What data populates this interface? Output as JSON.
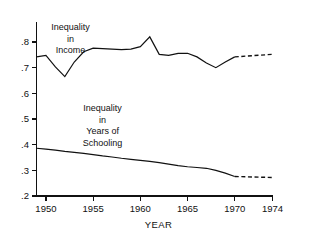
{
  "chart_data": {
    "type": "line",
    "title": "",
    "subtitle": "",
    "xlabel": "YEAR",
    "ylabel": "",
    "xlim": [
      1949,
      1974
    ],
    "ylim": [
      0.2,
      0.85
    ],
    "grid": false,
    "legend_position": "inline-annotations",
    "xticks": [
      1950,
      1955,
      1960,
      1965,
      1970,
      1974
    ],
    "xticklabels": [
      "1950",
      "1955",
      "1960",
      "1965",
      "1970",
      "1974"
    ],
    "yticks": [
      0.2,
      0.3,
      0.4,
      0.5,
      0.6,
      0.7,
      0.8
    ],
    "yticklabels": [
      ".2",
      ".3",
      ".4",
      ".5",
      ".6",
      ".7",
      ".8"
    ],
    "annotations": [
      {
        "name": "income-series-label",
        "lines": [
          "Inequality",
          "in",
          "Income"
        ],
        "text": "Inequality in Income",
        "x": 1952.6,
        "y": 0.845
      },
      {
        "name": "schooling-series-label",
        "lines": [
          "Inequality",
          "in",
          "Years of",
          "Schooling"
        ],
        "text": "Inequality in Years of Schooling",
        "x": 1956.0,
        "y": 0.53
      }
    ],
    "series": [
      {
        "name": "Inequality in Income",
        "style": "solid-then-dashed",
        "dash_start_year": 1970,
        "x": [
          1949,
          1950,
          1951,
          1952,
          1953,
          1954,
          1955,
          1956,
          1957,
          1958,
          1959,
          1960,
          1961,
          1962,
          1963,
          1964,
          1965,
          1966,
          1967,
          1968,
          1969,
          1970,
          1974
        ],
        "values": [
          0.742,
          0.748,
          0.703,
          0.665,
          0.722,
          0.762,
          0.776,
          0.774,
          0.772,
          0.77,
          0.772,
          0.782,
          0.82,
          0.752,
          0.748,
          0.756,
          0.756,
          0.742,
          0.718,
          0.7,
          0.722,
          0.742,
          0.752
        ]
      },
      {
        "name": "Inequality in Years of Schooling",
        "style": "solid-then-dashed",
        "dash_start_year": 1970,
        "x": [
          1949,
          1950,
          1951,
          1952,
          1953,
          1954,
          1955,
          1956,
          1957,
          1958,
          1959,
          1960,
          1961,
          1962,
          1963,
          1964,
          1965,
          1966,
          1967,
          1968,
          1969,
          1970,
          1974
        ],
        "values": [
          0.386,
          0.383,
          0.379,
          0.374,
          0.37,
          0.366,
          0.361,
          0.356,
          0.352,
          0.347,
          0.343,
          0.339,
          0.335,
          0.33,
          0.324,
          0.318,
          0.314,
          0.311,
          0.308,
          0.3,
          0.289,
          0.276,
          0.272
        ]
      }
    ]
  }
}
